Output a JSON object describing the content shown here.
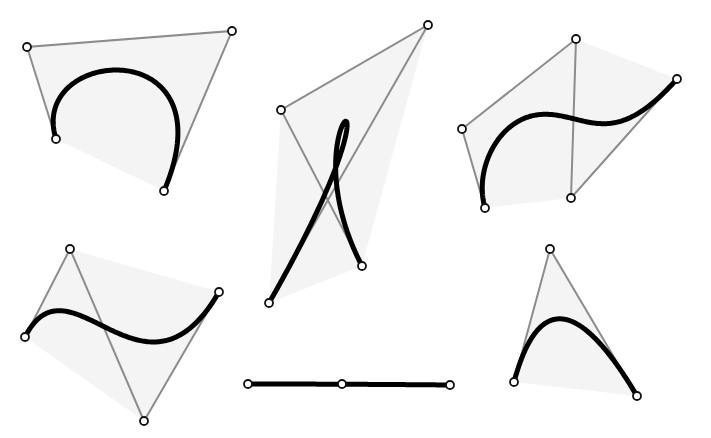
{
  "canvas": {
    "width": 711,
    "height": 438,
    "background": "#ffffff"
  },
  "style": {
    "hull_fill": "#f4f4f4",
    "control_line_color": "#8c8c8c",
    "control_line_width": 2,
    "curve_color": "#000000",
    "curve_width": 5,
    "point_stroke": "#111111",
    "point_stroke_width": 1.8,
    "point_radius": 4
  },
  "curves": [
    {
      "id": "cubic-arch",
      "type": "cubic",
      "points": [
        [
          56,
          139
        ],
        [
          27,
          47
        ],
        [
          232,
          31
        ],
        [
          164,
          191
        ]
      ],
      "hull": [
        [
          27,
          47
        ],
        [
          232,
          31
        ],
        [
          164,
          191
        ],
        [
          56,
          139
        ]
      ]
    },
    {
      "id": "cubic-loop",
      "type": "cubic",
      "points": [
        [
          269,
          303
        ],
        [
          428,
          25
        ],
        [
          281,
          110
        ],
        [
          362,
          266
        ]
      ],
      "hull": [
        [
          269,
          303
        ],
        [
          281,
          110
        ],
        [
          428,
          25
        ],
        [
          362,
          266
        ]
      ]
    },
    {
      "id": "quartic-wave",
      "type": "quartic",
      "points": [
        [
          485,
          208
        ],
        [
          462,
          129
        ],
        [
          576,
          39
        ],
        [
          571,
          198
        ],
        [
          677,
          79
        ]
      ],
      "hull": [
        [
          485,
          208
        ],
        [
          462,
          129
        ],
        [
          576,
          39
        ],
        [
          677,
          79
        ],
        [
          571,
          198
        ]
      ]
    },
    {
      "id": "cubic-s",
      "type": "cubic",
      "points": [
        [
          25,
          337
        ],
        [
          70,
          249
        ],
        [
          144,
          421
        ],
        [
          219,
          292
        ]
      ],
      "hull": [
        [
          25,
          337
        ],
        [
          70,
          249
        ],
        [
          219,
          292
        ],
        [
          144,
          421
        ]
      ]
    },
    {
      "id": "quadratic-line",
      "type": "quadratic",
      "points": [
        [
          248,
          384
        ],
        [
          342,
          384
        ],
        [
          450,
          385
        ]
      ],
      "hull": []
    },
    {
      "id": "quadratic-arch",
      "type": "quadratic",
      "points": [
        [
          514,
          382
        ],
        [
          550,
          249
        ],
        [
          637,
          396
        ]
      ],
      "hull": [
        [
          514,
          382
        ],
        [
          550,
          249
        ],
        [
          637,
          396
        ]
      ]
    }
  ]
}
